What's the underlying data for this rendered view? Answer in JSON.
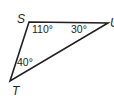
{
  "figure": {
    "type": "triangle",
    "stroke_color": "#231f20",
    "vertices": [
      {
        "label": "S",
        "x": 29,
        "y": 22
      },
      {
        "label": "U",
        "x": 108,
        "y": 23
      },
      {
        "label": "T",
        "x": 10,
        "y": 81
      }
    ],
    "angles": [
      {
        "vertex": "S",
        "label": "110°"
      },
      {
        "vertex": "U",
        "label": "30°"
      },
      {
        "vertex": "T",
        "label": "40°"
      }
    ]
  }
}
